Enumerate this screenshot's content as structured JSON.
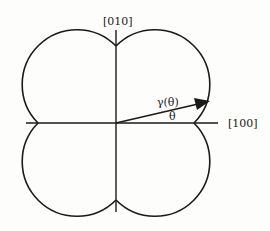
{
  "diagram": {
    "axis_y_label": "[010]",
    "axis_x_label": "[100]",
    "vector_label": "γ(θ)",
    "angle_label": "θ",
    "colors": {
      "stroke": "#1a1a1a",
      "background": "#fdfdfb"
    }
  }
}
